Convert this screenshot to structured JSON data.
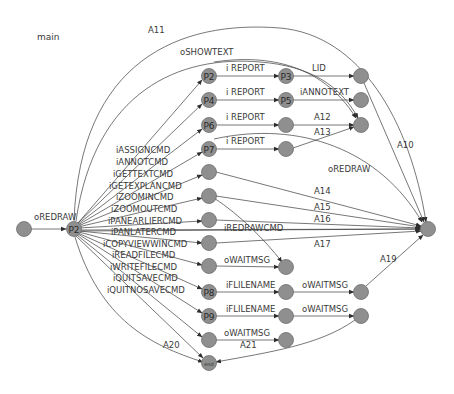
{
  "diagram": {
    "title": "main",
    "nodes": [
      {
        "id": "start",
        "label": "",
        "x": 24,
        "y": 229
      },
      {
        "id": "hub",
        "label": "P2",
        "x": 74,
        "y": 229
      },
      {
        "id": "c1_p2",
        "label": "P2",
        "x": 209,
        "y": 76
      },
      {
        "id": "c1_p4",
        "label": "P4",
        "x": 209,
        "y": 100
      },
      {
        "id": "c1_p6",
        "label": "P6",
        "x": 209,
        "y": 125
      },
      {
        "id": "c1_p7",
        "label": "P7",
        "x": 209,
        "y": 149
      },
      {
        "id": "c1_n5",
        "label": "",
        "x": 209,
        "y": 172
      },
      {
        "id": "c1_n6",
        "label": "",
        "x": 209,
        "y": 196
      },
      {
        "id": "c1_n7",
        "label": "",
        "x": 209,
        "y": 220
      },
      {
        "id": "c1_n8",
        "label": "",
        "x": 209,
        "y": 243
      },
      {
        "id": "c1_n9",
        "label": "",
        "x": 209,
        "y": 266
      },
      {
        "id": "c1_p8",
        "label": "P8",
        "x": 209,
        "y": 292
      },
      {
        "id": "c1_p9",
        "label": "P9",
        "x": 209,
        "y": 316
      },
      {
        "id": "c1_n12",
        "label": "",
        "x": 209,
        "y": 340
      },
      {
        "id": "end",
        "label": "end",
        "x": 209,
        "y": 363,
        "small": true
      },
      {
        "id": "c2_p3",
        "label": "P3",
        "x": 286,
        "y": 76
      },
      {
        "id": "c2_p5",
        "label": "P5",
        "x": 286,
        "y": 100
      },
      {
        "id": "c2_n3",
        "label": "",
        "x": 286,
        "y": 125
      },
      {
        "id": "c2_n4",
        "label": "",
        "x": 286,
        "y": 149
      },
      {
        "id": "c2_wait",
        "label": "",
        "x": 286,
        "y": 267
      },
      {
        "id": "c2_p8b",
        "label": "",
        "x": 286,
        "y": 292
      },
      {
        "id": "c2_p9b",
        "label": "",
        "x": 286,
        "y": 316
      },
      {
        "id": "c2_n12b",
        "label": "",
        "x": 286,
        "y": 340
      },
      {
        "id": "c3_n1",
        "label": "",
        "x": 361,
        "y": 76
      },
      {
        "id": "c3_n2",
        "label": "",
        "x": 361,
        "y": 100
      },
      {
        "id": "c3_n3",
        "label": "",
        "x": 361,
        "y": 125
      },
      {
        "id": "c3_n4",
        "label": "",
        "x": 361,
        "y": 292
      },
      {
        "id": "c3_n5",
        "label": "",
        "x": 361,
        "y": 316
      },
      {
        "id": "final",
        "label": "",
        "x": 428,
        "y": 229
      }
    ],
    "edges": [
      {
        "label": "oREDRAW",
        "path": "M31,229 L66,229",
        "lx": 34,
        "ly": 220
      },
      {
        "label": "A11",
        "path": "M74,221 C80,60 180,20 280,28 C360,35 410,120 426,222",
        "lx": 148,
        "ly": 33
      },
      {
        "label": "oSHOWTEXT",
        "path": "M76,221 C95,90 180,55 260,62 C310,66 340,85 358,118",
        "lx": 180,
        "ly": 55
      },
      {
        "label": "iASSIGNCMD",
        "path": "M78,223 L202,80",
        "lx": 116,
        "ly": 153
      },
      {
        "label": "iANNOTCMD",
        "path": "M78,223 L202,104",
        "lx": 116,
        "ly": 165
      },
      {
        "label": "iGETTEXTCMD",
        "path": "M78,224 L202,129",
        "lx": 113,
        "ly": 177
      },
      {
        "label": "iGETEXPLANCMD",
        "path": "M78,225 L202,152",
        "lx": 109,
        "ly": 189
      },
      {
        "label": "iZOOMINCMD",
        "path": "M78,226 L202,175",
        "lx": 116,
        "ly": 200
      },
      {
        "label": "iZOOMOUTCMD",
        "path": "M78,227 L202,198",
        "lx": 111,
        "ly": 212
      },
      {
        "label": "iPANEARLIERCMD",
        "path": "M79,228 L202,221",
        "lx": 108,
        "ly": 224
      },
      {
        "label": "iPANLATERCMD",
        "path": "M79,230 L420,229",
        "lx": 111,
        "ly": 235
      },
      {
        "label": "iCOPYVIEWWINCMD",
        "path": "M79,231 L202,243",
        "lx": 103,
        "ly": 247
      },
      {
        "label": "iREADFILECMD",
        "path": "M79,232 L202,265",
        "lx": 112,
        "ly": 258
      },
      {
        "label": "iWRITEFILECMD",
        "path": "M78,233 L202,289",
        "lx": 110,
        "ly": 270
      },
      {
        "label": "iQUITSAVECMD",
        "path": "M78,234 L202,313",
        "lx": 113,
        "ly": 281
      },
      {
        "label": "iQUITNOSAVECMD",
        "path": "M77,235 L202,337",
        "lx": 107,
        "ly": 293
      },
      {
        "label": "",
        "path": "M76,236 L203,358",
        "lx": 0,
        "ly": 0
      },
      {
        "label": "A20",
        "path": "M75,237 C100,320 150,345 203,362",
        "lx": 163,
        "ly": 348
      },
      {
        "label": "i REPORT",
        "path": "M216,76 L279,76",
        "lx": 226,
        "ly": 71
      },
      {
        "label": "i REPORT",
        "path": "M216,100 L279,100",
        "lx": 226,
        "ly": 95
      },
      {
        "label": "i REPORT",
        "path": "M216,125 L279,125",
        "lx": 226,
        "ly": 120
      },
      {
        "label": "i REPORT",
        "path": "M216,149 L279,149",
        "lx": 226,
        "ly": 144
      },
      {
        "label": "LID",
        "path": "M293,76 L354,76",
        "lx": 312,
        "ly": 71
      },
      {
        "label": "iANNOTEXT",
        "path": "M293,100 L354,100",
        "lx": 300,
        "ly": 95
      },
      {
        "label": "A12",
        "path": "M293,125 L354,125",
        "lx": 314,
        "ly": 120
      },
      {
        "label": "A13",
        "path": "M293,148 L354,127",
        "lx": 314,
        "ly": 135
      },
      {
        "label": "",
        "path": "M214,62 C260,55 320,60 356,118",
        "lx": 0,
        "ly": 0
      },
      {
        "label": "A10",
        "path": "M364,83 L424,222",
        "lx": 397,
        "ly": 148
      },
      {
        "label": "oREDRAW",
        "path": "M214,139 C300,120 380,150 422,222",
        "lx": 328,
        "ly": 172
      },
      {
        "label": "A14",
        "path": "M216,172 L421,226",
        "lx": 314,
        "ly": 194
      },
      {
        "label": "A15",
        "path": "M216,196 L421,227",
        "lx": 314,
        "ly": 210
      },
      {
        "label": "A16",
        "path": "M216,220 L421,228",
        "lx": 314,
        "ly": 222
      },
      {
        "label": "iREDRAWCMD",
        "path": "M80,231 L421,229",
        "lx": 224,
        "ly": 231
      },
      {
        "label": "A17",
        "path": "M216,243 L421,231",
        "lx": 314,
        "ly": 247
      },
      {
        "label": "",
        "path": "M214,198 C240,215 265,240 282,262",
        "lx": 0,
        "ly": 0
      },
      {
        "label": "oWAITMSG",
        "path": "M216,266 L279,267",
        "lx": 224,
        "ly": 263
      },
      {
        "label": "iFLILENAME",
        "path": "M216,292 L279,292",
        "lx": 226,
        "ly": 288
      },
      {
        "label": "iFLILENAME",
        "path": "M216,316 L279,316",
        "lx": 226,
        "ly": 312
      },
      {
        "label": "oWAITMSG",
        "path": "M216,340 L279,340",
        "lx": 224,
        "ly": 336
      },
      {
        "label": "oWAITMSG",
        "path": "M293,292 L354,292",
        "lx": 302,
        "ly": 288
      },
      {
        "label": "oWAITMSG",
        "path": "M293,316 L354,316",
        "lx": 302,
        "ly": 312
      },
      {
        "label": "A19",
        "path": "M366,286 L423,235",
        "lx": 380,
        "ly": 262
      },
      {
        "label": "A21",
        "path": "M355,320 C320,345 270,352 216,362",
        "lx": 240,
        "ly": 348
      }
    ]
  }
}
